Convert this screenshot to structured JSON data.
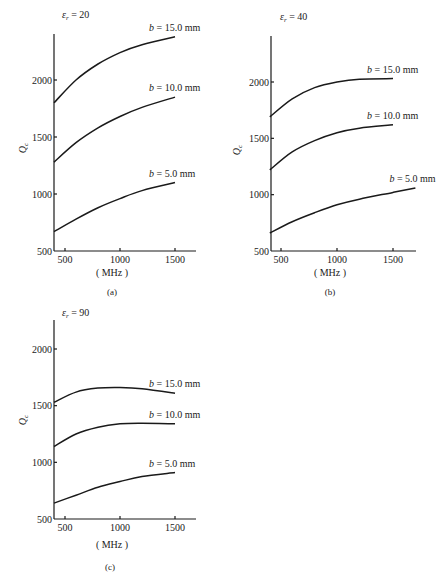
{
  "chart_data": [
    {
      "type": "line",
      "id": "a",
      "title": "εr = 20",
      "caption": "(a)",
      "xlabel": "(MHz)",
      "ylabel": "Qc",
      "xlim": [
        400,
        1700
      ],
      "ylim": [
        500,
        2400
      ],
      "xticks": [
        500,
        1000,
        1500
      ],
      "yticks": [
        500,
        1000,
        1500,
        2000
      ],
      "series": [
        {
          "name": "b = 15.0 mm",
          "x": [
            400,
            600,
            800,
            1000,
            1200,
            1500
          ],
          "values": [
            1800,
            2000,
            2140,
            2240,
            2310,
            2380
          ]
        },
        {
          "name": "b = 10.0 mm",
          "x": [
            400,
            600,
            800,
            1000,
            1200,
            1500
          ],
          "values": [
            1280,
            1450,
            1580,
            1680,
            1760,
            1850
          ]
        },
        {
          "name": "b = 5.0 mm",
          "x": [
            400,
            600,
            800,
            1000,
            1200,
            1500
          ],
          "values": [
            670,
            780,
            880,
            960,
            1030,
            1100
          ]
        }
      ]
    },
    {
      "type": "line",
      "id": "b",
      "title": "εr = 40",
      "caption": "(b)",
      "xlabel": "(MHz)",
      "ylabel": "Qc",
      "xlim": [
        400,
        1700
      ],
      "ylim": [
        500,
        2400
      ],
      "xticks": [
        500,
        1000,
        1500
      ],
      "yticks": [
        500,
        1000,
        1500,
        2000
      ],
      "series": [
        {
          "name": "b = 15.0 mm",
          "x": [
            400,
            600,
            800,
            1000,
            1200,
            1500
          ],
          "values": [
            1690,
            1850,
            1950,
            2000,
            2025,
            2030
          ]
        },
        {
          "name": "b = 10.0 mm",
          "x": [
            400,
            600,
            800,
            1000,
            1200,
            1500
          ],
          "values": [
            1220,
            1380,
            1480,
            1550,
            1590,
            1620
          ]
        },
        {
          "name": "b = 5.0 mm",
          "x": [
            400,
            600,
            800,
            1000,
            1200,
            1500,
            1700
          ],
          "values": [
            660,
            760,
            840,
            910,
            960,
            1020,
            1060
          ]
        }
      ]
    },
    {
      "type": "line",
      "id": "c",
      "title": "εr = 90",
      "caption": "(c)",
      "xlabel": "(MHz)",
      "ylabel": "Qc",
      "xlim": [
        400,
        1700
      ],
      "ylim": [
        500,
        2400
      ],
      "xticks": [
        500,
        1000,
        1500
      ],
      "yticks": [
        500,
        1000,
        1500,
        2000
      ],
      "series": [
        {
          "name": "b = 15.0 mm",
          "x": [
            400,
            600,
            800,
            1000,
            1200,
            1500
          ],
          "values": [
            1530,
            1620,
            1655,
            1660,
            1650,
            1610
          ]
        },
        {
          "name": "b = 10.0 mm",
          "x": [
            400,
            600,
            800,
            1000,
            1200,
            1500
          ],
          "values": [
            1140,
            1250,
            1310,
            1340,
            1345,
            1340
          ]
        },
        {
          "name": "b = 5.0 mm",
          "x": [
            400,
            600,
            800,
            1000,
            1200,
            1500
          ],
          "values": [
            640,
            710,
            780,
            830,
            875,
            910
          ]
        }
      ]
    }
  ],
  "panels": {
    "a": {
      "title": "εr = 20",
      "caption": "(a)",
      "unit": "(MHz)",
      "ylabel": "Qc"
    },
    "b": {
      "title": "εr = 40",
      "caption": "(b)",
      "unit": "(MHz)",
      "ylabel": "Qc"
    },
    "c": {
      "title": "εr = 90",
      "caption": "(c)",
      "unit": "(MHz)",
      "ylabel": "Qc"
    }
  }
}
